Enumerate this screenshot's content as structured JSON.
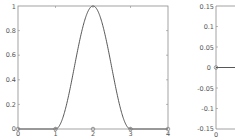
{
  "chart_data": [
    {
      "type": "line",
      "title": "",
      "xlabel": "",
      "ylabel": "",
      "xlim": [
        0,
        4
      ],
      "ylim": [
        0,
        1
      ],
      "grid": false,
      "legend": null,
      "xticks": [
        "0",
        "1",
        "2",
        "3",
        "4"
      ],
      "yticks": [
        "0",
        "0.2",
        "0.4",
        "0.6",
        "0.8",
        "1"
      ],
      "series": [
        {
          "name": "bump",
          "style": "solid line",
          "x": [
            0,
            1,
            1.25,
            1.5,
            1.75,
            2,
            2.25,
            2.5,
            2.75,
            3,
            4
          ],
          "y": [
            0,
            0,
            0.146,
            0.5,
            0.854,
            1,
            0.854,
            0.5,
            0.146,
            0,
            0
          ]
        },
        {
          "name": "nodes",
          "style": "circle markers",
          "x": [
            0,
            1,
            2,
            3,
            4
          ],
          "y": [
            0,
            0,
            0,
            0,
            0
          ]
        }
      ]
    },
    {
      "type": "line",
      "title": "",
      "xlabel": "",
      "ylabel": "",
      "xlim": [
        0,
        null
      ],
      "ylim": [
        -0.15,
        0.15
      ],
      "grid": false,
      "legend": null,
      "xticks": [
        "0"
      ],
      "yticks": [
        "-0.15",
        "-0.1",
        "-0.05",
        "0",
        "0.05",
        "0.1",
        "0.15"
      ],
      "series": [
        {
          "name": "zero",
          "style": "solid line with circle marker",
          "x": [
            0
          ],
          "y": [
            0
          ]
        }
      ],
      "note": "plot truncated at right image edge"
    }
  ],
  "left": {
    "xtick_labels": [
      "0",
      "1",
      "2",
      "3",
      "4"
    ],
    "ytick_labels": [
      "0",
      "0.2",
      "0.4",
      "0.6",
      "0.8",
      "1"
    ]
  },
  "right": {
    "xtick_labels": [
      "0"
    ],
    "ytick_labels": [
      "0.15",
      "0.1",
      "0.05",
      "0",
      "-0.05",
      "-0.1",
      "-0.15"
    ]
  }
}
